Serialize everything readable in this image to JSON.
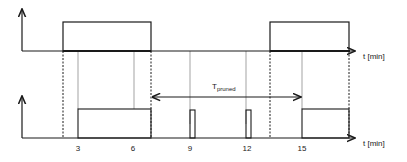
{
  "diagram": {
    "type": "timing-diagram",
    "top_axis": {
      "label": "t [min]"
    },
    "bottom_axis": {
      "label": "t [min]",
      "ticks": [
        "3",
        "6",
        "9",
        "12",
        "15"
      ]
    },
    "annotation": {
      "label_main": "T",
      "label_sub": "pruned"
    },
    "colors": {
      "line": "#1a1a1a",
      "thin_line": "#555555",
      "background": "#ffffff"
    }
  }
}
